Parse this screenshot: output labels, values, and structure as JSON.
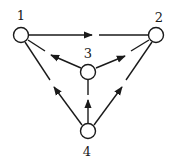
{
  "diagram": {
    "type": "directed-graph",
    "colors": {
      "stroke": "#1a1a1a",
      "node_fill": "#ffffff",
      "background": "#ffffff"
    },
    "nodes": [
      {
        "id": "1",
        "label": "1",
        "cx": 21,
        "cy": 35
      },
      {
        "id": "2",
        "label": "2",
        "cx": 156,
        "cy": 35
      },
      {
        "id": "3",
        "label": "3",
        "cx": 88,
        "cy": 72
      },
      {
        "id": "4",
        "label": "4",
        "cx": 88,
        "cy": 131
      }
    ],
    "edges": [
      {
        "from": "1",
        "to": "2"
      },
      {
        "from": "3",
        "to": "1"
      },
      {
        "from": "3",
        "to": "2"
      },
      {
        "from": "4",
        "to": "1"
      },
      {
        "from": "4",
        "to": "2"
      },
      {
        "from": "4",
        "to": "3"
      }
    ]
  }
}
